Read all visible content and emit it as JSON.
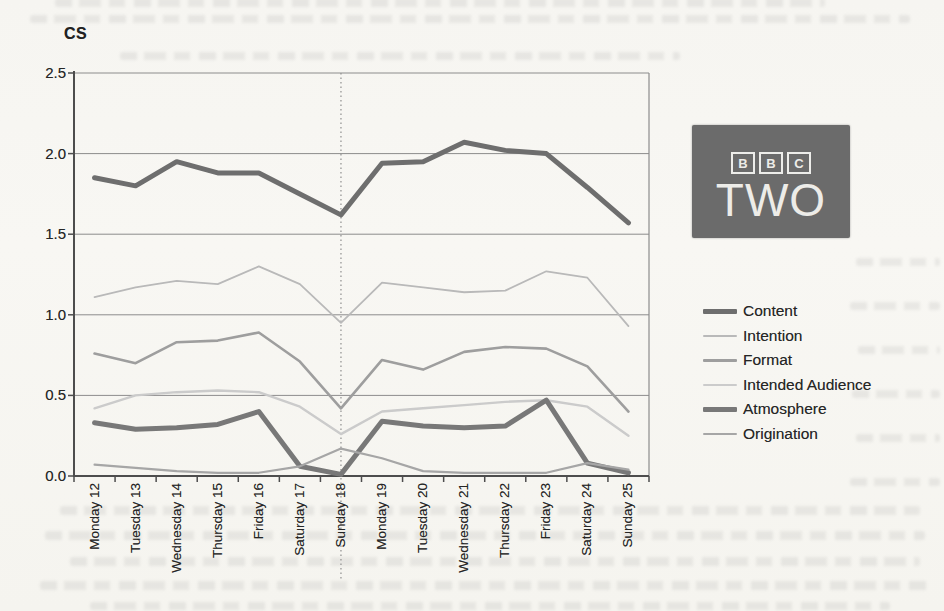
{
  "chart_data": {
    "type": "line",
    "ylabel": "CS",
    "categories": [
      "Monday 12",
      "Tuesday 13",
      "Wednesday 14",
      "Thursday 15",
      "Friday 16",
      "Saturday 17",
      "Sunday 18",
      "Monday 19",
      "Tuesday 20",
      "Wednesday 21",
      "Thursday 22",
      "Friday 23",
      "Saturday 24",
      "Sunday 25"
    ],
    "series": [
      {
        "name": "Content",
        "color": "#6e6e6e",
        "width": 5,
        "values": [
          1.85,
          1.8,
          1.95,
          1.88,
          1.88,
          1.75,
          1.62,
          1.94,
          1.95,
          2.07,
          2.02,
          2.0,
          1.79,
          1.57
        ]
      },
      {
        "name": "Intention",
        "color": "#b9b9b9",
        "width": 1.8,
        "values": [
          1.11,
          1.17,
          1.21,
          1.19,
          1.3,
          1.19,
          0.95,
          1.2,
          1.17,
          1.14,
          1.15,
          1.27,
          1.23,
          0.93
        ]
      },
      {
        "name": "Format",
        "color": "#9e9e9e",
        "width": 2.6,
        "values": [
          0.76,
          0.7,
          0.83,
          0.84,
          0.89,
          0.71,
          0.42,
          0.72,
          0.66,
          0.77,
          0.8,
          0.79,
          0.68,
          0.4
        ]
      },
      {
        "name": "Intended Audience",
        "color": "#cbcbcb",
        "width": 2.4,
        "values": [
          0.42,
          0.5,
          0.52,
          0.53,
          0.52,
          0.43,
          0.26,
          0.4,
          0.42,
          0.44,
          0.46,
          0.47,
          0.43,
          0.25
        ]
      },
      {
        "name": "Atmosphere",
        "color": "#787878",
        "width": 5,
        "values": [
          0.33,
          0.29,
          0.3,
          0.32,
          0.4,
          0.06,
          0.01,
          0.34,
          0.31,
          0.3,
          0.31,
          0.47,
          0.08,
          0.02
        ]
      },
      {
        "name": "Origination",
        "color": "#a6a6a6",
        "width": 2.2,
        "values": [
          0.07,
          0.05,
          0.03,
          0.02,
          0.02,
          0.06,
          0.17,
          0.11,
          0.03,
          0.02,
          0.02,
          0.02,
          0.08,
          0.04
        ]
      }
    ],
    "ylim": [
      0,
      2.5
    ],
    "ytick_labels": [
      "0.0",
      "0.5",
      "1.0",
      "1.5",
      "2.0",
      "2.5"
    ],
    "ytick_values": [
      0,
      0.5,
      1.0,
      1.5,
      2.0,
      2.5
    ],
    "grid": true,
    "grid_color": "#8c8c8c",
    "axis_color": "#4d4d4d",
    "legend_position": "right",
    "reference_line": {
      "category": "Sunday 18",
      "style": "dotted",
      "color": "#8f8f8f"
    }
  },
  "logo": {
    "brand_top_letters": [
      "B",
      "B",
      "C"
    ],
    "brand_bottom": "TWO",
    "background": "#6b6b6b",
    "foreground": "#edece8"
  }
}
